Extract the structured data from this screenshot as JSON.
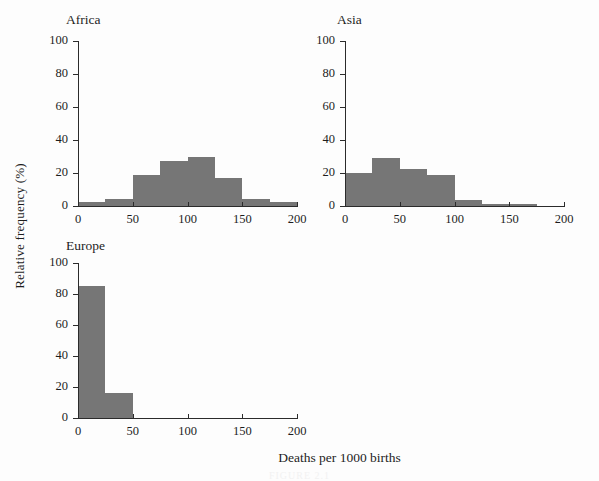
{
  "figure": {
    "xlabel": "Deaths per 1000 births",
    "ylabel": "Relative frequency (%)",
    "caption": "FIGURE 2.1"
  },
  "axis": {
    "y_ticks": [
      "0",
      "20",
      "40",
      "60",
      "80",
      "100"
    ],
    "x_ticks": [
      "0",
      "50",
      "100",
      "150",
      "200"
    ]
  },
  "panels": {
    "africa": {
      "title": "Africa"
    },
    "asia": {
      "title": "Asia"
    },
    "europe": {
      "title": "Europe"
    }
  },
  "colors": {
    "bar": "#767676",
    "axis": "#2b2b2b",
    "background": "#fdfdfd"
  },
  "chart_data": [
    {
      "type": "bar",
      "title": "Africa",
      "xlabel": "Deaths per 1000 births",
      "ylabel": "Relative frequency (%)",
      "xlim": [
        0,
        200
      ],
      "ylim": [
        0,
        100
      ],
      "bin_width": 25,
      "bin_edges": [
        0,
        25,
        50,
        75,
        100,
        125,
        150,
        175,
        200
      ],
      "categories": [
        "0-25",
        "25-50",
        "50-75",
        "75-100",
        "100-125",
        "125-150",
        "150-175",
        "175-200"
      ],
      "values": [
        2.5,
        4,
        19,
        27,
        30,
        17,
        4.5,
        2.5
      ],
      "grid": false,
      "legend": "none"
    },
    {
      "type": "bar",
      "title": "Asia",
      "xlabel": "Deaths per 1000 births",
      "ylabel": "Relative frequency (%)",
      "xlim": [
        0,
        200
      ],
      "ylim": [
        0,
        100
      ],
      "bin_width": 25,
      "bin_edges": [
        0,
        25,
        50,
        75,
        100,
        125,
        150,
        175
      ],
      "categories": [
        "0-25",
        "25-50",
        "50-75",
        "75-100",
        "100-125",
        "125-150",
        "150-175"
      ],
      "values": [
        20,
        29,
        22.5,
        18.5,
        3.5,
        1.5,
        1.5
      ],
      "grid": false,
      "legend": "none"
    },
    {
      "type": "bar",
      "title": "Europe",
      "xlabel": "Deaths per 1000 births",
      "ylabel": "Relative frequency (%)",
      "xlim": [
        0,
        200
      ],
      "ylim": [
        0,
        100
      ],
      "bin_width": 25,
      "bin_edges": [
        0,
        25,
        50
      ],
      "categories": [
        "0-25",
        "25-50"
      ],
      "values": [
        85,
        16
      ],
      "grid": false,
      "legend": "none"
    }
  ]
}
